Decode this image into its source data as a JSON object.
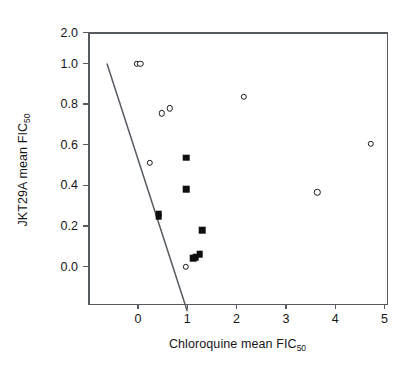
{
  "chart_data": {
    "type": "scatter",
    "title": "",
    "xlabel": "Chloroquine mean FIC",
    "xlabel_sub": "50",
    "ylabel": "JKT29A mean FIC",
    "ylabel_sub": "50",
    "xlim": [
      -0.65,
      5.2
    ],
    "ylim": [
      -0.22,
      2.0
    ],
    "xticks": [
      0,
      1,
      2,
      3,
      4,
      5
    ],
    "xtick_labels": [
      "0",
      "1",
      "2",
      "3",
      "4",
      "5"
    ],
    "yticks": [
      0.0,
      0.2,
      0.4,
      0.6,
      0.8,
      1.0,
      2.0
    ],
    "ytick_labels": [
      "0.0",
      "0.2",
      "0.4",
      "0.6",
      "0.8",
      "1.0",
      "2.0"
    ],
    "y_axis_note": "broken axis: 0.0-1.0 linear, then compressed jump to 2.0",
    "grid": false,
    "legend": null,
    "series": [
      {
        "name": "open-circle",
        "marker": "open-circle",
        "points": [
          {
            "x": -0.02,
            "y": 1.0
          },
          {
            "x": 0.05,
            "y": 1.0
          },
          {
            "x": 0.48,
            "y": 0.755
          },
          {
            "x": 0.65,
            "y": 0.78
          },
          {
            "x": 0.24,
            "y": 0.51
          },
          {
            "x": 2.14,
            "y": 0.835
          },
          {
            "x": 3.64,
            "y": 0.365
          },
          {
            "x": 4.72,
            "y": 0.605
          },
          {
            "x": 0.97,
            "y": 0.0
          }
        ]
      },
      {
        "name": "filled-square",
        "marker": "filled-square",
        "points": [
          {
            "x": 0.98,
            "y": 0.535
          },
          {
            "x": 0.98,
            "y": 0.38
          },
          {
            "x": 0.42,
            "y": 0.26
          },
          {
            "x": 0.42,
            "y": 0.245
          },
          {
            "x": 1.3,
            "y": 0.18
          },
          {
            "x": 1.12,
            "y": 0.04
          },
          {
            "x": 1.17,
            "y": 0.045
          },
          {
            "x": 1.25,
            "y": 0.06
          }
        ]
      }
    ],
    "annotations": [
      {
        "type": "line",
        "name": "synergy-threshold-line",
        "from": {
          "x": -0.63,
          "y": 1.0
        },
        "to": {
          "x": 1.0,
          "y": -0.22
        },
        "color": "#555b60"
      }
    ],
    "colors": {
      "axis": "#555b60",
      "marker_edge": "#1b1b1b",
      "marker_fill_open": "#ffffff",
      "marker_fill_solid": "#0f0f0f",
      "text": "#161616",
      "background": "#ffffff"
    }
  }
}
